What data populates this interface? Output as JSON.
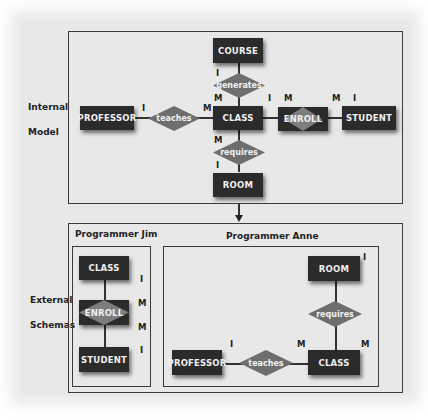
{
  "internal_model": {
    "label_line1": "Internal",
    "label_line2": "Model",
    "entities": {
      "course": "COURSE",
      "professor": "PROFESSOR",
      "class": "CLASS",
      "student": "STUDENT",
      "room": "ROOM"
    },
    "relationships": {
      "generates": "generates",
      "teaches": "teaches",
      "enroll": "ENROLL",
      "requires": "requires"
    },
    "cardinalities": {
      "course_generates": "I",
      "generates_class": "M",
      "professor_teaches": "I",
      "teaches_class": "M",
      "class_enroll": "I",
      "enroll_left": "M",
      "enroll_right": "M",
      "student_enroll": "I",
      "class_requires": "M",
      "room_requires": "I"
    }
  },
  "external_schemas": {
    "label_line1": "External",
    "label_line2": "Schemas",
    "programmer_jim": {
      "title": "Programmer Jim",
      "entities": {
        "class": "CLASS",
        "student": "STUDENT"
      },
      "relationship": "ENROLL",
      "cardinalities": [
        "I",
        "M",
        "M",
        "I"
      ]
    },
    "programmer_anne": {
      "title": "Programmer Anne",
      "entities": {
        "room": "ROOM",
        "professor": "PROFESSOR",
        "class": "CLASS"
      },
      "relationships": {
        "requires": "requires",
        "teaches": "teaches"
      },
      "cardinalities": {
        "room": "I",
        "professor": "I",
        "teaches_class": "M",
        "requires_class": "M"
      }
    }
  },
  "colors": {
    "entity_fill": "#2b2b2b",
    "relationship_fill": "#6e6e6e",
    "background": "#e8e8e8",
    "frame": "#3a3a3a"
  }
}
